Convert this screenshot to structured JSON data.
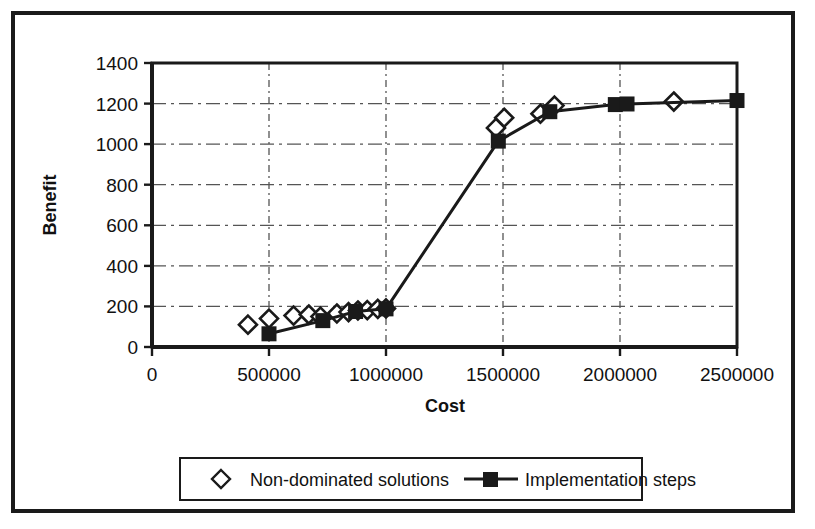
{
  "chart_data": {
    "type": "scatter",
    "title": "",
    "xlabel": "Cost",
    "ylabel": "Benefit",
    "xlim": [
      0,
      2500000
    ],
    "ylim": [
      0,
      1400
    ],
    "xticks": [
      0,
      500000,
      1000000,
      1500000,
      2000000,
      2500000
    ],
    "xtick_labels": [
      "0",
      "500000",
      "1000000",
      "1500000",
      "2000000",
      "2500000"
    ],
    "yticks": [
      0,
      200,
      400,
      600,
      800,
      1000,
      1200,
      1400
    ],
    "ytick_labels": [
      "0",
      "200",
      "400",
      "600",
      "800",
      "1000",
      "1200",
      "1400"
    ],
    "grid": "dashed horizontal and vertical gridlines inside plot",
    "legend_position": "below plot, centered, boxed",
    "series": [
      {
        "name": "Non-dominated solutions",
        "marker": "open-diamond",
        "line": "none",
        "color": "#1a1a1a",
        "points": [
          [
            410000,
            110
          ],
          [
            500000,
            140
          ],
          [
            605000,
            155
          ],
          [
            670000,
            160
          ],
          [
            720000,
            150
          ],
          [
            790000,
            165
          ],
          [
            840000,
            172
          ],
          [
            880000,
            180
          ],
          [
            920000,
            182
          ],
          [
            965000,
            188
          ],
          [
            1000000,
            190
          ],
          [
            1470000,
            1080
          ],
          [
            1505000,
            1130
          ],
          [
            1660000,
            1150
          ],
          [
            1720000,
            1190
          ],
          [
            2230000,
            1210
          ]
        ]
      },
      {
        "name": "Implementation steps",
        "marker": "filled-square",
        "line": "solid",
        "color": "#1a1a1a",
        "points": [
          [
            500000,
            65
          ],
          [
            730000,
            130
          ],
          [
            870000,
            175
          ],
          [
            1000000,
            188
          ],
          [
            1480000,
            1015
          ],
          [
            1700000,
            1160
          ],
          [
            1980000,
            1195
          ],
          [
            2030000,
            1198
          ],
          [
            2500000,
            1215
          ]
        ]
      }
    ]
  },
  "legend": {
    "items": [
      {
        "label": "Non-dominated solutions",
        "marker": "open-diamond",
        "has_line": false
      },
      {
        "label": "Implementation steps",
        "marker": "filled-square",
        "has_line": true
      }
    ]
  },
  "colors": {
    "ink": "#1a1a1a",
    "grid": "#555555",
    "background": "#ffffff"
  }
}
